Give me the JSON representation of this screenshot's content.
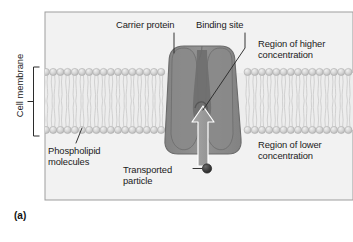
{
  "figure": {
    "panel_letter": "(a)",
    "background_color": "#f2f2f2",
    "frame_color": "#9a9a9a"
  },
  "labels": {
    "carrier_protein": "Carrier protein",
    "binding_site": "Binding site",
    "region_higher": "Region of higher\nconcentration",
    "region_lower": "Region of lower\nconcentration",
    "phospholipid_molecules": "Phospholipid\nmolecules",
    "transported_particle": "Transported\nparticle",
    "cell_membrane": "Cell membrane"
  },
  "colors": {
    "membrane_head": "#cfcfcf",
    "membrane_head_stroke": "#a8a8a8",
    "membrane_tail": "#d8d8d8",
    "protein_fill": "#8d8d8d",
    "protein_stroke": "#6e6e6e",
    "protein_channel": "#6f6f6f",
    "arrow_fill": "#9c9c9c",
    "arrow_stroke": "#ffffff",
    "particle_fill": "#3b3b3b",
    "leader_line": "#2b2b2b",
    "text": "#1a1a1a"
  },
  "diagram": {
    "bilayer": {
      "top_head_center_y": 72,
      "bottom_head_center_y": 130,
      "head_radius": 3.6,
      "head_spacing": 7.2,
      "tail_count_per_leaflet": 2
    },
    "protein": {
      "top_y": 48,
      "bottom_y": 152,
      "top_width": 66,
      "bottom_width": 54,
      "center_x": 202
    },
    "arrow": {
      "direction": "up",
      "tail_y": 168,
      "head_y": 108,
      "center_x": 203
    },
    "particle": {
      "center_x": 207,
      "center_y": 168,
      "radius": 4.6
    },
    "membrane_bracket": {
      "top_y": 67,
      "bottom_y": 136,
      "x": 34
    }
  }
}
